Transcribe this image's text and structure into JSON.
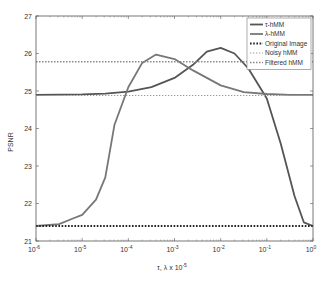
{
  "chart_data": {
    "type": "line",
    "title": "",
    "xlabel": "τ, λ x 10^-5",
    "ylabel": "PSNR",
    "xscale": "log",
    "xlim": [
      1e-06,
      1
    ],
    "ylim": [
      21,
      27
    ],
    "grid": false,
    "legend_position": "upper right",
    "x_ticks": [
      "10^-6",
      "10^-5",
      "10^-4",
      "10^-3",
      "10^-2",
      "10^-1",
      "10^0"
    ],
    "y_ticks": [
      "21",
      "22",
      "23",
      "24",
      "25",
      "26",
      "27"
    ],
    "series": [
      {
        "name": "τ-hMM",
        "style": "solid",
        "color": "#555555",
        "log10_x": [
          -6,
          -5,
          -4.5,
          -4,
          -3.5,
          -3,
          -2.6,
          -2.3,
          -2.0,
          -1.7,
          -1.4,
          -1.0,
          -0.7,
          -0.4,
          -0.2,
          0
        ],
        "values": [
          24.9,
          24.91,
          24.93,
          24.98,
          25.1,
          25.35,
          25.7,
          26.05,
          26.15,
          26.0,
          25.6,
          24.8,
          23.6,
          22.2,
          21.5,
          21.4
        ]
      },
      {
        "name": "λ-hMM",
        "style": "solid",
        "color": "#777777",
        "log10_x": [
          -6,
          -5.5,
          -5.2,
          -5.0,
          -4.7,
          -4.5,
          -4.3,
          -4.0,
          -3.7,
          -3.4,
          -3.0,
          -2.6,
          -2.0,
          -1.5,
          -1.0,
          -0.5,
          0
        ],
        "values": [
          21.4,
          21.45,
          21.6,
          21.7,
          22.1,
          22.7,
          24.1,
          25.1,
          25.75,
          25.97,
          25.85,
          25.55,
          25.15,
          24.97,
          24.92,
          24.9,
          24.9
        ]
      },
      {
        "name": "Original Image",
        "style": "dotted-heavy",
        "color": "#222222",
        "log10_x": [
          -6,
          0
        ],
        "values": [
          21.4,
          21.4
        ]
      },
      {
        "name": "Noisy hMM",
        "style": "dotted-light",
        "color": "#999999",
        "log10_x": [
          -6,
          0
        ],
        "values": [
          24.88,
          24.88
        ]
      },
      {
        "name": "Filtered hMM",
        "style": "dotted",
        "color": "#888888",
        "log10_x": [
          -6,
          0
        ],
        "values": [
          25.78,
          25.78
        ]
      }
    ]
  }
}
